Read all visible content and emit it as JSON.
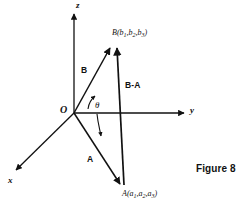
{
  "figure": {
    "caption": "Figure 8",
    "ink_color": "#111111",
    "background_color": "#ffffff"
  },
  "axes": {
    "z": {
      "label": "z",
      "direction": "up"
    },
    "y": {
      "label": "y",
      "direction": "right"
    },
    "x": {
      "label": "x",
      "direction": "down-left"
    },
    "origin": {
      "label": "O"
    }
  },
  "vectors": [
    {
      "id": "B",
      "label": "B",
      "from": "O",
      "to": "B"
    },
    {
      "id": "A",
      "label": "A",
      "from": "O",
      "to": "A"
    },
    {
      "id": "B-A",
      "label": "B-A",
      "from": "A",
      "to": "B"
    }
  ],
  "points": [
    {
      "id": "B",
      "name": "B",
      "coords": [
        "b",
        "b",
        "b"
      ],
      "subs": [
        "1",
        "2",
        "3"
      ],
      "open_paren": "(",
      "close_paren": ")",
      "comma": ","
    },
    {
      "id": "A",
      "name": "A",
      "coords": [
        "a",
        "a",
        "a"
      ],
      "subs": [
        "1",
        "2",
        "3"
      ],
      "open_paren": "(",
      "close_paren": ")",
      "comma": ","
    }
  ],
  "angle": {
    "symbol": "θ",
    "between": [
      "A",
      "B"
    ]
  },
  "bleed_text": "  "
}
